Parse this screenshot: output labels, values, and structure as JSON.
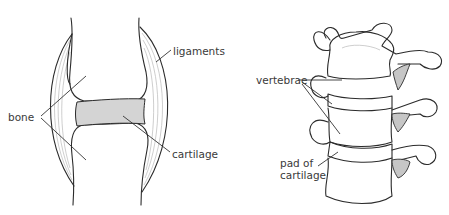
{
  "figure": {
    "panels": [
      {
        "id": "joint",
        "title": "joint",
        "labels": {
          "bone": "bone",
          "ligaments": "ligaments",
          "cartilage": "cartilage"
        }
      },
      {
        "id": "spine",
        "title": "spine",
        "labels": {
          "vertebrae": "vertebrae",
          "pad_line1": "pad of",
          "pad_line2": "cartilage"
        }
      }
    ],
    "colors": {
      "outline": "#2b2b2b",
      "cartilage_fill": "#d4d4d4",
      "bone_fill": "#ffffff",
      "shade": "#e9e9e9",
      "ligament_lines": "#b9b9b9",
      "text": "#3a3a3a"
    }
  }
}
